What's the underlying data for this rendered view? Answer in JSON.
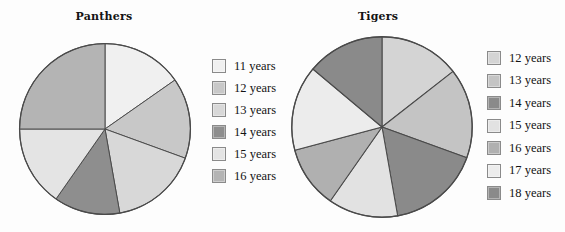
{
  "page": {
    "background_color": "#fdfdfd",
    "width": 565,
    "height": 232
  },
  "palette": {
    "c11": "#f0f0f0",
    "c12": "#c8c8c8",
    "c13": "#d8d8d8",
    "c14": "#8e8e8e",
    "c15": "#e4e4e4",
    "c16": "#b4b4b4",
    "c17": "#ececec",
    "c18": "#8e8e8e",
    "outline": "#4a4a4a",
    "swatch_border": "#8a8a8a",
    "text": "#131313"
  },
  "panthers": {
    "title": "Panthers",
    "legend": [
      {
        "label": "11 years",
        "color": "#f0f0f0",
        "swatch_name": "legend-swatch-11-years"
      },
      {
        "label": "12 years",
        "color": "#c8c8c8",
        "swatch_name": "legend-swatch-12-years"
      },
      {
        "label": "13 years",
        "color": "#d8d8d8",
        "swatch_name": "legend-swatch-13-years"
      },
      {
        "label": "14 years",
        "color": "#8e8e8e",
        "swatch_name": "legend-swatch-14-years"
      },
      {
        "label": "15 years",
        "color": "#e4e4e4",
        "swatch_name": "legend-swatch-15-years"
      },
      {
        "label": "16 years",
        "color": "#b4b4b4",
        "swatch_name": "legend-swatch-16-years"
      }
    ]
  },
  "tigers": {
    "title": "Tigers",
    "legend": [
      {
        "label": "12 years",
        "color": "#d4d4d4",
        "swatch_name": "legend-swatch-12-years"
      },
      {
        "label": "13 years",
        "color": "#c4c4c4",
        "swatch_name": "legend-swatch-13-years"
      },
      {
        "label": "14 years",
        "color": "#8a8a8a",
        "swatch_name": "legend-swatch-14-years"
      },
      {
        "label": "15 years",
        "color": "#e2e2e2",
        "swatch_name": "legend-swatch-15-years"
      },
      {
        "label": "16 years",
        "color": "#b0b0b0",
        "swatch_name": "legend-swatch-16-years"
      },
      {
        "label": "17 years",
        "color": "#ececec",
        "swatch_name": "legend-swatch-17-years"
      },
      {
        "label": "18 years",
        "color": "#8a8a8a",
        "swatch_name": "legend-swatch-18-years"
      }
    ]
  },
  "chart_data": [
    {
      "type": "pie",
      "title": "Panthers",
      "name": "panthers-pie",
      "start_angle_deg": 0,
      "direction": "clockwise",
      "categories": [
        "11 years",
        "12 years",
        "13 years",
        "14 years",
        "15 years",
        "16 years"
      ],
      "angles_deg": [
        55,
        55,
        60,
        45,
        55,
        90
      ],
      "values_percent": [
        15.3,
        15.3,
        16.7,
        12.5,
        15.3,
        25.0
      ],
      "boundaries_deg": [
        0,
        55,
        110,
        170,
        215,
        270,
        360
      ],
      "colors": [
        "#f0f0f0",
        "#c8c8c8",
        "#d8d8d8",
        "#8e8e8e",
        "#e4e4e4",
        "#b4b4b4"
      ],
      "legend_position": "right",
      "grid": false
    },
    {
      "type": "pie",
      "title": "Tigers",
      "name": "tigers-pie",
      "start_angle_deg": 0,
      "direction": "clockwise",
      "categories": [
        "12 years",
        "13 years",
        "14 years",
        "15 years",
        "16 years",
        "17 years",
        "18 years"
      ],
      "angles_deg": [
        52,
        58,
        60,
        45,
        40,
        55,
        50
      ],
      "values_percent": [
        14.4,
        16.1,
        16.7,
        12.5,
        11.1,
        15.3,
        13.9
      ],
      "boundaries_deg": [
        0,
        52,
        110,
        170,
        215,
        255,
        310,
        360
      ],
      "colors": [
        "#d4d4d4",
        "#c4c4c4",
        "#8a8a8a",
        "#e2e2e2",
        "#b0b0b0",
        "#ececec",
        "#8a8a8a"
      ],
      "legend_position": "right",
      "grid": false
    }
  ]
}
